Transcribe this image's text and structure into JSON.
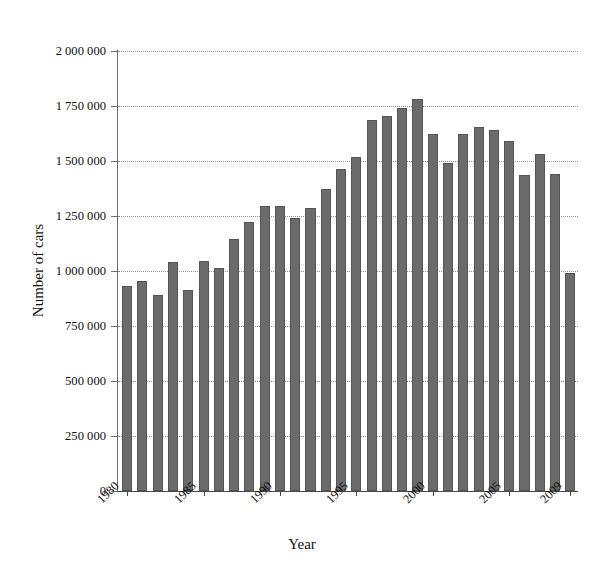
{
  "chart_data": {
    "type": "bar",
    "title": "",
    "xlabel": "Year",
    "ylabel": "Number of cars",
    "categories": [
      1980,
      1981,
      1982,
      1983,
      1984,
      1985,
      1986,
      1987,
      1988,
      1989,
      1990,
      1991,
      1992,
      1993,
      1994,
      1995,
      1996,
      1997,
      1998,
      1999,
      2000,
      2001,
      2002,
      2003,
      2004,
      2005,
      2006,
      2007,
      2008,
      2009
    ],
    "values": [
      930000,
      955000,
      890000,
      1040000,
      915000,
      1045000,
      1015000,
      1145000,
      1225000,
      1295000,
      1295000,
      1240000,
      1285000,
      1375000,
      1465000,
      1520000,
      1685000,
      1705000,
      1740000,
      1780000,
      1625000,
      1490000,
      1625000,
      1655000,
      1640000,
      1590000,
      1435000,
      1530000,
      1440000,
      990000
    ],
    "ylim": [
      0,
      2000000
    ],
    "xlim": [
      1979.5,
      2009.5
    ],
    "grid": true,
    "grid_axis": "y",
    "legend": "none",
    "bar_color": "#6b6b6b",
    "ytick_values": [
      0,
      250000,
      500000,
      750000,
      1000000,
      1250000,
      1500000,
      1750000,
      2000000
    ],
    "ytick_labels": [
      "0",
      "250 000",
      "500 000",
      "750 000",
      "1 000 000",
      "1 250 000",
      "1 500 000",
      "1 750 000",
      "2 000 000"
    ],
    "xtick_values": [
      1980,
      1985,
      1990,
      1995,
      2000,
      2005,
      2009
    ],
    "xtick_labels": [
      "1980",
      "1985",
      "1990",
      "1995",
      "2000",
      "2005",
      "2009"
    ],
    "xtick_rotation": -45
  }
}
